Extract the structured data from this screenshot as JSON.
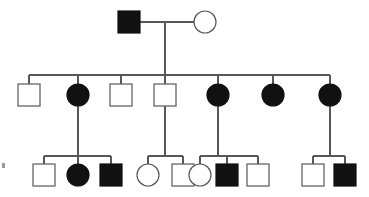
{
  "figure": {
    "kind": "pedigree-chart",
    "title": "",
    "width": 369,
    "height": 197,
    "background_color": "#ffffff",
    "line_color": "#58585a",
    "affected_fill_color": "#111111",
    "unaffected_fill_color": "#ffffff",
    "symbol_size": 22,
    "legend_note": "square = male, circle = female, filled = affected, open = unaffected"
  },
  "generations": [
    {
      "id": "I",
      "label": "I",
      "y_center": 22,
      "individuals": [
        {
          "id": "I-1",
          "shape": "square",
          "sex": "male",
          "status": "affected",
          "filled": true,
          "cx": 129,
          "cy": 22
        },
        {
          "id": "I-2",
          "shape": "circle",
          "sex": "female",
          "status": "unaffected",
          "filled": false,
          "cx": 205,
          "cy": 22
        }
      ]
    },
    {
      "id": "II",
      "label": "II",
      "y_center": 95,
      "individuals": [
        {
          "id": "II-1",
          "shape": "square",
          "sex": "male",
          "status": "unaffected",
          "filled": false,
          "cx": 29,
          "cy": 95
        },
        {
          "id": "II-2",
          "shape": "circle",
          "sex": "female",
          "status": "affected",
          "filled": true,
          "cx": 78,
          "cy": 95
        },
        {
          "id": "II-3",
          "shape": "square",
          "sex": "male",
          "status": "unaffected",
          "filled": false,
          "cx": 121,
          "cy": 95
        },
        {
          "id": "II-4",
          "shape": "square",
          "sex": "male",
          "status": "unaffected",
          "filled": false,
          "cx": 165,
          "cy": 95
        },
        {
          "id": "II-5",
          "shape": "circle",
          "sex": "female",
          "status": "affected",
          "filled": true,
          "cx": 218,
          "cy": 95
        },
        {
          "id": "II-6",
          "shape": "circle",
          "sex": "female",
          "status": "affected",
          "filled": true,
          "cx": 273,
          "cy": 95
        },
        {
          "id": "II-7",
          "shape": "circle",
          "sex": "female",
          "status": "affected",
          "filled": true,
          "cx": 330,
          "cy": 95
        }
      ]
    },
    {
      "id": "III",
      "label": "III",
      "y_center": 175,
      "individuals": [
        {
          "id": "III-1",
          "shape": "square",
          "sex": "male",
          "status": "unaffected",
          "filled": false,
          "cx": 44,
          "cy": 175
        },
        {
          "id": "III-2",
          "shape": "circle",
          "sex": "female",
          "status": "affected",
          "filled": true,
          "cx": 78,
          "cy": 175
        },
        {
          "id": "III-3",
          "shape": "square",
          "sex": "male",
          "status": "affected",
          "filled": true,
          "cx": 111,
          "cy": 175
        },
        {
          "id": "III-4",
          "shape": "circle",
          "sex": "female",
          "status": "unaffected",
          "filled": false,
          "cx": 148,
          "cy": 175
        },
        {
          "id": "III-5",
          "shape": "square",
          "sex": "male",
          "status": "unaffected",
          "filled": false,
          "cx": 183,
          "cy": 175
        },
        {
          "id": "III-6",
          "shape": "circle",
          "sex": "female",
          "status": "unaffected",
          "filled": false,
          "cx": 200,
          "cy": 175
        },
        {
          "id": "III-7",
          "shape": "square",
          "sex": "male",
          "status": "affected",
          "filled": true,
          "cx": 227,
          "cy": 175
        },
        {
          "id": "III-8",
          "shape": "square",
          "sex": "male",
          "status": "unaffected",
          "filled": false,
          "cx": 258,
          "cy": 175
        },
        {
          "id": "III-9",
          "shape": "square",
          "sex": "male",
          "status": "unaffected",
          "filled": false,
          "cx": 313,
          "cy": 175
        },
        {
          "id": "III-10",
          "shape": "square",
          "sex": "male",
          "status": "affected",
          "filled": true,
          "cx": 345,
          "cy": 175
        }
      ]
    }
  ],
  "connections": {
    "mating_lines": [
      {
        "id": "mate-I",
        "x1": 140,
        "x2": 194,
        "y": 22,
        "partners": [
          "I-1",
          "I-2"
        ]
      }
    ],
    "descent_lines": [
      {
        "id": "descent-I",
        "x": 165,
        "y1": 22,
        "y2": 75,
        "from": "mate-I"
      },
      {
        "id": "descent-II-2",
        "x": 78,
        "y1": 106,
        "y2": 156,
        "from": "II-2"
      },
      {
        "id": "descent-II-4",
        "x": 165,
        "y1": 106,
        "y2": 156,
        "from": "II-4"
      },
      {
        "id": "descent-II-5",
        "x": 218,
        "y1": 106,
        "y2": 156,
        "from": "II-5"
      },
      {
        "id": "descent-II-7",
        "x": 330,
        "y1": 106,
        "y2": 156,
        "from": "II-7"
      }
    ],
    "sibship_lines": [
      {
        "id": "sibship-II",
        "x1": 29,
        "x2": 330,
        "y": 75,
        "children": [
          "II-1",
          "II-2",
          "II-3",
          "II-4",
          "II-5",
          "II-6",
          "II-7"
        ]
      },
      {
        "id": "sibship-III-a",
        "x1": 44,
        "x2": 111,
        "y": 156,
        "children": [
          "III-1",
          "III-2",
          "III-3"
        ]
      },
      {
        "id": "sibship-III-b",
        "x1": 148,
        "x2": 183,
        "y": 156,
        "children": [
          "III-4",
          "III-5"
        ]
      },
      {
        "id": "sibship-III-c",
        "x1": 200,
        "x2": 258,
        "y": 156,
        "children": [
          "III-6",
          "III-7",
          "III-8"
        ]
      },
      {
        "id": "sibship-III-d",
        "x1": 313,
        "x2": 345,
        "y": 156,
        "children": [
          "III-9",
          "III-10"
        ]
      }
    ],
    "child_stubs": [
      {
        "id": "stub-II-1",
        "x": 29,
        "y1": 75,
        "y2": 84
      },
      {
        "id": "stub-II-2",
        "x": 78,
        "y1": 75,
        "y2": 84
      },
      {
        "id": "stub-II-3",
        "x": 121,
        "y1": 75,
        "y2": 84
      },
      {
        "id": "stub-II-4",
        "x": 165,
        "y1": 75,
        "y2": 84
      },
      {
        "id": "stub-II-5",
        "x": 218,
        "y1": 75,
        "y2": 84
      },
      {
        "id": "stub-II-6",
        "x": 273,
        "y1": 75,
        "y2": 84
      },
      {
        "id": "stub-II-7",
        "x": 330,
        "y1": 75,
        "y2": 84
      },
      {
        "id": "stub-III-1",
        "x": 44,
        "y1": 156,
        "y2": 164
      },
      {
        "id": "stub-III-2",
        "x": 78,
        "y1": 156,
        "y2": 164
      },
      {
        "id": "stub-III-3",
        "x": 111,
        "y1": 156,
        "y2": 164
      },
      {
        "id": "stub-III-4",
        "x": 148,
        "y1": 156,
        "y2": 164
      },
      {
        "id": "stub-III-5",
        "x": 183,
        "y1": 156,
        "y2": 164
      },
      {
        "id": "stub-III-6",
        "x": 200,
        "y1": 156,
        "y2": 164
      },
      {
        "id": "stub-III-7",
        "x": 227,
        "y1": 156,
        "y2": 164
      },
      {
        "id": "stub-III-8",
        "x": 258,
        "y1": 156,
        "y2": 164
      },
      {
        "id": "stub-III-9",
        "x": 313,
        "y1": 156,
        "y2": 164
      },
      {
        "id": "stub-III-10",
        "x": 345,
        "y1": 156,
        "y2": 164
      }
    ]
  },
  "artifacts": [
    {
      "id": "edge-speck-left",
      "x": 2,
      "y": 163,
      "w": 3,
      "h": 5
    }
  ]
}
